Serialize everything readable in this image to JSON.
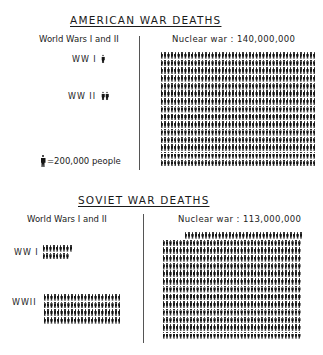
{
  "chart_data": [
    {
      "type": "pictogram",
      "title": "AMERICAN WAR DEATHS",
      "unit": "1 figure = 200,000 people",
      "left_panel_label": "World Wars I and II",
      "right_panel_label": "Nuclear war: 140,000,000",
      "categories": [
        "WW I",
        "WW II",
        "Nuclear war"
      ],
      "values": [
        116000,
        405000,
        140000000
      ],
      "figures": [
        0.6,
        2,
        700
      ],
      "layout": {
        "nuclear_rows": 15,
        "nuclear_per_row": 46
      }
    },
    {
      "type": "pictogram",
      "title": "SOVIET WAR DEATHS",
      "unit": "1 figure = 200,000 people",
      "left_panel_label": "World Wars I and II",
      "right_panel_label": "Nuclear war: 113,000,000",
      "categories": [
        "WW I",
        "WW II",
        "Nuclear war"
      ],
      "values": [
        3000000,
        20000000,
        113000000
      ],
      "figures": [
        15,
        100,
        565
      ],
      "layout": {
        "ww1_rows": [
          9,
          8
        ],
        "ww2_rows": 4,
        "ww2_per_row": 23,
        "nuclear_rows": 14,
        "nuclear_per_row": 41,
        "nuclear_first_row": 35
      }
    }
  ],
  "american": {
    "title": "AMERICAN WAR DEATHS",
    "left_header": "World Wars I and II",
    "right_header": "Nuclear war : 140,000,000",
    "ww1_label": "WW I",
    "ww2_label": "WW II",
    "legend": "=200,000 people"
  },
  "soviet": {
    "title": "SOVIET WAR DEATHS",
    "left_header": "World Wars I and II",
    "right_header": "Nuclear war : 113,000,000",
    "ww1_label": "WW I",
    "ww2_label": "WWII"
  }
}
